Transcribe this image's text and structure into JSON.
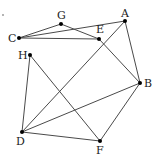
{
  "diagram": {
    "type": "graph",
    "nodes": [
      {
        "id": "A",
        "label": "A",
        "x": 125,
        "y": 21,
        "lx": 121,
        "ly": 17
      },
      {
        "id": "B",
        "label": "B",
        "x": 140,
        "y": 83,
        "lx": 144,
        "ly": 87
      },
      {
        "id": "C",
        "label": "C",
        "x": 19,
        "y": 38,
        "lx": 8,
        "ly": 42
      },
      {
        "id": "D",
        "label": "D",
        "x": 22,
        "y": 132,
        "lx": 16,
        "ly": 145
      },
      {
        "id": "E",
        "label": "E",
        "x": 99,
        "y": 39,
        "lx": 96,
        "ly": 33
      },
      {
        "id": "F",
        "label": "F",
        "x": 100,
        "y": 141,
        "lx": 96,
        "ly": 154
      },
      {
        "id": "G",
        "label": "G",
        "x": 61,
        "y": 24,
        "lx": 57,
        "ly": 19
      },
      {
        "id": "H",
        "label": "H",
        "x": 30,
        "y": 55,
        "lx": 18,
        "ly": 59
      }
    ],
    "edges": [
      [
        "C",
        "G"
      ],
      [
        "G",
        "E"
      ],
      [
        "C",
        "A"
      ],
      [
        "C",
        "E"
      ],
      [
        "A",
        "B"
      ],
      [
        "A",
        "D"
      ],
      [
        "E",
        "B"
      ],
      [
        "H",
        "D"
      ],
      [
        "H",
        "F"
      ],
      [
        "D",
        "B"
      ],
      [
        "D",
        "F"
      ],
      [
        "F",
        "B"
      ]
    ],
    "colors": {
      "edge": "#4a4a4a",
      "node": "#000000",
      "label": "#222222"
    }
  }
}
